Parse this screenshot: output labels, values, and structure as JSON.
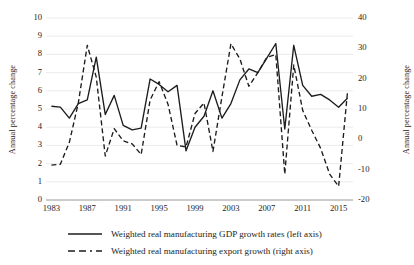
{
  "chart_data": {
    "type": "line",
    "title": "",
    "xlabel": "",
    "ylabel": "Annual percentage change",
    "ylabel_right": "Annual percentage change",
    "grid": true,
    "legend_position": "bottom",
    "x": [
      1983,
      1984,
      1985,
      1986,
      1987,
      1988,
      1989,
      1990,
      1991,
      1992,
      1993,
      1994,
      1995,
      1996,
      1997,
      1998,
      1999,
      2000,
      2001,
      2002,
      2003,
      2004,
      2005,
      2006,
      2007,
      2008,
      2009,
      2010,
      2011,
      2012,
      2013,
      2014,
      2015,
      2016
    ],
    "xticks": [
      1983,
      1987,
      1991,
      1995,
      1999,
      2003,
      2007,
      2011,
      2015
    ],
    "xlim": [
      1982.4,
      2016.6
    ],
    "yticks_left": [
      0,
      1,
      2,
      3,
      4,
      5,
      6,
      7,
      8,
      9,
      10
    ],
    "ylim_left": [
      0,
      10
    ],
    "yticks_right": [
      -20,
      -10,
      0,
      10,
      20,
      30,
      40
    ],
    "ylim_right": [
      -20,
      40
    ],
    "series": [
      {
        "name": "Weighted real manufacturing GDP growth rates (left axis)",
        "axis": "left",
        "style": "solid",
        "color": "#1c1c1c",
        "values": [
          5.15,
          5.1,
          4.5,
          5.3,
          5.5,
          7.85,
          4.7,
          5.75,
          4.1,
          3.85,
          3.95,
          6.65,
          6.35,
          5.95,
          6.3,
          2.7,
          4.0,
          4.6,
          6.0,
          4.5,
          5.3,
          6.6,
          7.2,
          7.0,
          7.8,
          8.6,
          3.9,
          8.5,
          6.3,
          5.7,
          5.8,
          5.5,
          5.1,
          5.6
        ]
      },
      {
        "name": "Weighted real manufacturing export growth (right axis)",
        "axis": "right",
        "style": "dashed",
        "color": "#1c1c1c",
        "values": [
          -8.5,
          -8.2,
          -1.0,
          12.0,
          31.0,
          20.5,
          -5.5,
          3.5,
          -0.5,
          -1.5,
          -5.0,
          13.0,
          19.0,
          11.5,
          -2.0,
          -2.5,
          8.5,
          12.0,
          -4.0,
          14.0,
          31.5,
          26.5,
          17.5,
          22.0,
          27.0,
          28.0,
          -11.5,
          24.5,
          9.5,
          3.0,
          -3.0,
          -11.5,
          -15.5,
          16.0
        ]
      }
    ]
  },
  "legend": {
    "items": [
      {
        "label": "Weighted real manufacturing GDP growth rates (left axis)",
        "style": "solid"
      },
      {
        "label": "Weighted real manufacturing export growth (right axis)",
        "style": "dashed"
      }
    ]
  },
  "axes": {
    "left_title": "Annual percentage change",
    "right_title": "Annual percentage change"
  }
}
